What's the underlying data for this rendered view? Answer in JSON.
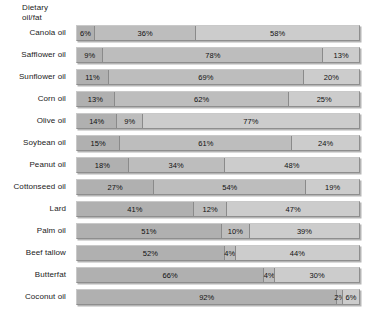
{
  "chart_data": {
    "type": "bar",
    "subtype": "stacked-horizontal-100",
    "title": "",
    "xlabel": "",
    "ylabel": "Dietary oil/fat",
    "axis_title_lines": "Dietary\noil/fat",
    "xlim": [
      0,
      100
    ],
    "unit": "%",
    "grid": false,
    "legend": "none",
    "categories": [
      "Canola oil",
      "Safflower oil",
      "Sunflower oil",
      "Corn oil",
      "Olive oil",
      "Soybean oil",
      "Peanut oil",
      "Cottonseed oil",
      "Lard",
      "Palm oil",
      "Beef tallow",
      "Butterfat",
      "Coconut oil"
    ],
    "series": [
      {
        "name": "Saturated fat",
        "values": [
          6,
          9,
          11,
          13,
          14,
          15,
          18,
          27,
          41,
          51,
          52,
          66,
          92
        ]
      },
      {
        "name": "Polyunsaturated fat",
        "values": [
          36,
          78,
          69,
          62,
          9,
          61,
          34,
          54,
          12,
          10,
          4,
          4,
          2
        ]
      },
      {
        "name": "Monounsaturated fat",
        "values": [
          58,
          13,
          20,
          25,
          77,
          24,
          48,
          19,
          47,
          39,
          44,
          30,
          6
        ]
      }
    ],
    "rows": [
      {
        "label": "Canola oil",
        "segments": [
          {
            "value": 6,
            "text": "6%"
          },
          {
            "value": 36,
            "text": "36%"
          },
          {
            "value": 58,
            "text": "58%"
          }
        ]
      },
      {
        "label": "Safflower oil",
        "segments": [
          {
            "value": 9,
            "text": "9%"
          },
          {
            "value": 78,
            "text": "78%"
          },
          {
            "value": 13,
            "text": "13%"
          }
        ]
      },
      {
        "label": "Sunflower oil",
        "segments": [
          {
            "value": 11,
            "text": "11%"
          },
          {
            "value": 69,
            "text": "69%"
          },
          {
            "value": 20,
            "text": "20%"
          }
        ]
      },
      {
        "label": "Corn oil",
        "segments": [
          {
            "value": 13,
            "text": "13%"
          },
          {
            "value": 62,
            "text": "62%"
          },
          {
            "value": 25,
            "text": "25%"
          }
        ]
      },
      {
        "label": "Olive oil",
        "segments": [
          {
            "value": 14,
            "text": "14%"
          },
          {
            "value": 9,
            "text": "9%"
          },
          {
            "value": 77,
            "text": "77%"
          }
        ]
      },
      {
        "label": "Soybean oil",
        "segments": [
          {
            "value": 15,
            "text": "15%"
          },
          {
            "value": 61,
            "text": "61%"
          },
          {
            "value": 24,
            "text": "24%"
          }
        ]
      },
      {
        "label": "Peanut oil",
        "segments": [
          {
            "value": 18,
            "text": "18%"
          },
          {
            "value": 34,
            "text": "34%"
          },
          {
            "value": 48,
            "text": "48%"
          }
        ]
      },
      {
        "label": "Cottonseed oil",
        "segments": [
          {
            "value": 27,
            "text": "27%"
          },
          {
            "value": 54,
            "text": "54%"
          },
          {
            "value": 19,
            "text": "19%"
          }
        ]
      },
      {
        "label": "Lard",
        "segments": [
          {
            "value": 41,
            "text": "41%"
          },
          {
            "value": 12,
            "text": "12%"
          },
          {
            "value": 47,
            "text": "47%"
          }
        ]
      },
      {
        "label": "Palm oil",
        "segments": [
          {
            "value": 51,
            "text": "51%"
          },
          {
            "value": 10,
            "text": "10%"
          },
          {
            "value": 39,
            "text": "39%"
          }
        ]
      },
      {
        "label": "Beef tallow",
        "segments": [
          {
            "value": 52,
            "text": "52%"
          },
          {
            "value": 4,
            "text": "4%"
          },
          {
            "value": 44,
            "text": "44%"
          }
        ]
      },
      {
        "label": "Butterfat",
        "segments": [
          {
            "value": 66,
            "text": "66%"
          },
          {
            "value": 4,
            "text": "4%"
          },
          {
            "value": 30,
            "text": "30%"
          }
        ]
      },
      {
        "label": "Coconut oil",
        "segments": [
          {
            "value": 92,
            "text": "92%"
          },
          {
            "value": 2,
            "text": "2%"
          },
          {
            "value": 6,
            "text": "6%"
          }
        ]
      }
    ],
    "colors": {
      "segment_1": "#b0b0b0",
      "segment_2": "#bdbdbd",
      "segment_3": "#cccccc",
      "bar_border": "#8e8e8e",
      "text": "#111111",
      "background": "#ffffff"
    }
  }
}
